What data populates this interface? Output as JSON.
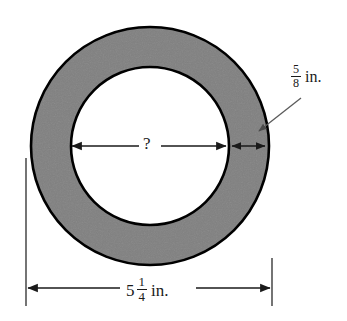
{
  "figure": {
    "kind": "geometry-diagram",
    "shape_name": "annulus",
    "background_color": "#ffffff",
    "ring_fill_color": "#808080",
    "hole_fill_color": "#ffffff",
    "outline_color": "#000000",
    "dimension_line_color": "#1a1a1a",
    "leader_line_color": "#5a5a5a"
  },
  "shape": {
    "outer_circle": {
      "cx": 150,
      "cy": 146,
      "r": 119
    },
    "inner_circle": {
      "cx": 150,
      "cy": 146,
      "r": 79
    }
  },
  "labels": {
    "ring_thickness": {
      "name": "ring-thickness-label",
      "numerator": "5",
      "denominator": "8",
      "unit": "in."
    },
    "outer_diameter": {
      "name": "outer-diameter-label",
      "whole": "5",
      "numerator": "1",
      "denominator": "4",
      "unit": "in."
    },
    "inner_diameter": {
      "name": "inner-diameter-label",
      "text": "?"
    }
  },
  "dimensions": {
    "inner_diameter_arrow": {
      "name": "inner-diameter-dimension-arrow",
      "y": 146,
      "x_start": 71,
      "x_end": 227,
      "gap_start": 139,
      "gap_end": 161,
      "double_headed": true
    },
    "ring_thickness_arrow": {
      "name": "ring-thickness-dimension-arrow",
      "y": 146,
      "x_start": 231,
      "x_end": 266,
      "double_headed": true
    },
    "outer_diameter_arrow": {
      "name": "outer-diameter-dimension-arrow",
      "y": 288,
      "x_start": 27,
      "x_end": 271,
      "gap_start": 118,
      "gap_end": 196,
      "double_headed": true
    },
    "extension_line_left": {
      "name": "extension-line-left",
      "x": 26,
      "y_top": 158,
      "y_bottom": 306
    },
    "extension_line_right": {
      "name": "extension-line-right",
      "x": 272,
      "y_top": 258,
      "y_bottom": 306
    },
    "leader_line": {
      "name": "ring-thickness-leader-line",
      "x1": 301,
      "y1": 98,
      "x2": 258,
      "y2": 132
    }
  }
}
